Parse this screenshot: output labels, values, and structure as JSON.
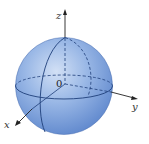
{
  "figure": {
    "axes": {
      "x_label": "x",
      "y_label": "y",
      "z_label": "z",
      "origin_label": "0"
    },
    "colors": {
      "sphere_fill": "#8fb0e3",
      "sphere_highlight": "#c8d8f2",
      "sphere_shadow": "#5a82c8",
      "grid_lines": "#1f3f7a",
      "axes": "#222222"
    }
  }
}
